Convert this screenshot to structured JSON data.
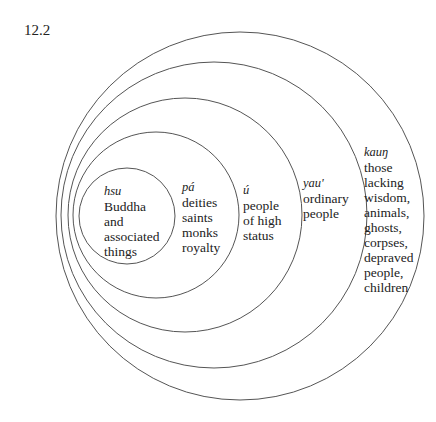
{
  "figure": {
    "number": "12.2",
    "rings": [
      {
        "term": "hsu",
        "lines": [
          "Buddha",
          "and",
          "associated",
          "things"
        ],
        "cx": 127,
        "cy": 216,
        "r": 48,
        "label_x": 104,
        "label_y": 184
      },
      {
        "term": "pá",
        "lines": [
          "deities",
          "saints",
          "monks",
          "royalty"
        ],
        "cx": 156,
        "cy": 215,
        "r": 83,
        "label_x": 182,
        "label_y": 180
      },
      {
        "term": "ú",
        "lines": [
          "people",
          "of high",
          "status"
        ],
        "cx": 185,
        "cy": 215,
        "r": 117,
        "label_x": 243,
        "label_y": 183
      },
      {
        "term": "yau'",
        "lines": [
          "ordinary",
          "people"
        ],
        "cx": 214,
        "cy": 215,
        "r": 153,
        "label_x": 303,
        "label_y": 176
      },
      {
        "term": "kauŋ",
        "lines": [
          "those",
          "lacking",
          "wisdom,",
          "animals,",
          "ghosts,",
          "corpses,",
          "depraved",
          "people,",
          "children"
        ],
        "cx": 240,
        "cy": 216,
        "r": 184,
        "label_x": 364,
        "label_y": 145
      }
    ],
    "stroke_color": "#555555"
  }
}
